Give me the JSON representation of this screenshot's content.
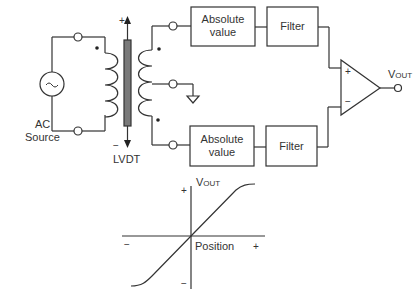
{
  "circuit": {
    "source": {
      "label_line1": "AC",
      "label_line2": "Source",
      "symbol": "~"
    },
    "transformer": {
      "label": "LVDT",
      "core_plus": "+",
      "core_minus": "−"
    },
    "top_chain": {
      "abs_label_line1": "Absolute",
      "abs_label_line2": "value",
      "filter_label": "Filter"
    },
    "bottom_chain": {
      "abs_label_line1": "Absolute",
      "abs_label_line2": "value",
      "filter_label": "Filter"
    },
    "opamp": {
      "plus": "+",
      "minus": "−"
    },
    "output": {
      "label_main": "V",
      "label_sub": "OUT"
    }
  },
  "graph": {
    "ylabel_main": "V",
    "ylabel_sub": "OUT",
    "xlabel": "Position",
    "y_plus": "+",
    "y_minus": "−",
    "x_plus": "+",
    "x_minus": "−"
  },
  "colors": {
    "line": "#333333",
    "core_fill": "#7a7a7a"
  }
}
